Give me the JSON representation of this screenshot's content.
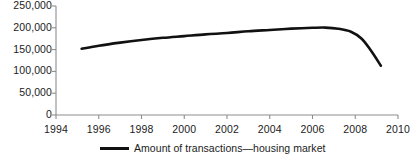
{
  "chart_data": {
    "type": "line",
    "title": "",
    "xlabel": "",
    "ylabel": "",
    "xlim": [
      1994,
      2010
    ],
    "ylim": [
      0,
      250000
    ],
    "grid": false,
    "legend_position": "bottom",
    "x_ticks": [
      "1994",
      "1996",
      "1998",
      "2000",
      "2002",
      "2004",
      "2006",
      "2008",
      "2010"
    ],
    "y_ticks": [
      "0",
      "50,000",
      "100,000",
      "150,000",
      "200,000",
      "250,000"
    ],
    "series": [
      {
        "name": "Amount of transactions—housing market",
        "color": "#111111",
        "x": [
          1995.2,
          1996.0,
          1997.0,
          1998.0,
          1999.0,
          2000.0,
          2001.0,
          2002.0,
          2003.0,
          2004.0,
          2005.0,
          2006.0,
          2006.6,
          2007.2,
          2007.8,
          2008.3,
          2008.7,
          2009.2
        ],
        "values": [
          152000,
          159000,
          166000,
          172000,
          177000,
          181000,
          185000,
          188000,
          192000,
          195000,
          198000,
          200000,
          200500,
          198000,
          191000,
          175000,
          150000,
          113000
        ]
      }
    ]
  },
  "legend": {
    "entries": [
      {
        "label": "Amount of transactions—housing market"
      }
    ]
  }
}
